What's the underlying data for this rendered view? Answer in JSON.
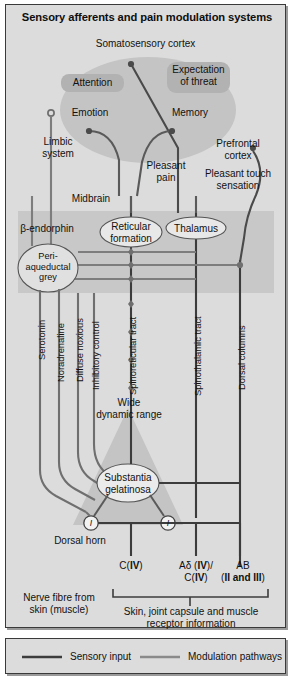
{
  "figure": {
    "title": "Sensory afferents and pain modulation systems",
    "colors": {
      "panel_background": "#dcdcdc",
      "panel_border": "#3a3a3a",
      "limbic_ellipse": "#c2c2c2",
      "brain_band": "#c6c6c6",
      "box_fill": "#b4b4b4",
      "node_ellipse": "#e2e2e2",
      "dorsal_horn_triangle": "#c4c4c4",
      "sensory_input_line": "#3c3c3c",
      "modulation_line": "#7d7d7d",
      "text": "#111111"
    }
  },
  "regions": {
    "somatosensory_cortex": "Somatosensory cortex",
    "attention": "Attention",
    "expectation_of_threat": "Expectation\nof threat",
    "emotion": "Emotion",
    "memory": "Memory",
    "limbic_system": "Limbic\nsystem",
    "prefrontal_cortex": "Prefrontal\ncortex",
    "pleasant_pain": "Pleasant\npain",
    "pleasant_touch_sensation": "Pleasant touch\nsensation",
    "midbrain": "Midbrain",
    "beta_endorphin": "β-endorphin",
    "reticular_formation": "Reticular\nformation",
    "thalamus": "Thalamus",
    "periaqueductal_grey": "Peri-\naqueductal\ngrey",
    "wide_dynamic_range": "Wide\ndynamic range",
    "substantia_gelatinosa": "Substantia\ngelatinosa",
    "dorsal_horn": "Dorsal horn",
    "nerve_fibre_from_skin": "Nerve fibre from\nskin (muscle)",
    "receptor_information": "Skin, joint capsule and muscle\nreceptor information"
  },
  "tracts": [
    {
      "id": "serotonin",
      "label": "Serotonin"
    },
    {
      "id": "noradrenaline",
      "label": "Noradrenaline"
    },
    {
      "id": "diffuse-noxious",
      "label": "Diffuse noxious"
    },
    {
      "id": "inhibitory-control",
      "label": "Inhibitory control"
    },
    {
      "id": "spinoreticular-tract",
      "label": "Spinoreticular tract"
    },
    {
      "id": "spinothalamic-tract",
      "label": "Spinothalamic tract"
    },
    {
      "id": "dorsal-columns",
      "label": "Dorsal columns"
    }
  ],
  "afferents": [
    {
      "id": "c-fibre",
      "line1": "C(",
      "roman1": "IV",
      "line1b": ")",
      "line2": "",
      "roman2": "",
      "line2b": ""
    },
    {
      "id": "a-delta",
      "line1": "Aδ (",
      "roman1": "IV",
      "line1b": ")/",
      "line2": "C(",
      "roman2": "IV",
      "line2b": ")"
    },
    {
      "id": "a-beta",
      "line1": "AB",
      "roman1": "",
      "line1b": "",
      "line2": "(",
      "roman2": "II and III",
      "line2b": ")"
    }
  ],
  "interneurons": [
    {
      "id": "interneuron-left",
      "label": "I"
    },
    {
      "id": "interneuron-right",
      "label": "I"
    }
  ],
  "legend": {
    "sensory_input": "Sensory input",
    "modulation_pathways": "Modulation pathways"
  }
}
